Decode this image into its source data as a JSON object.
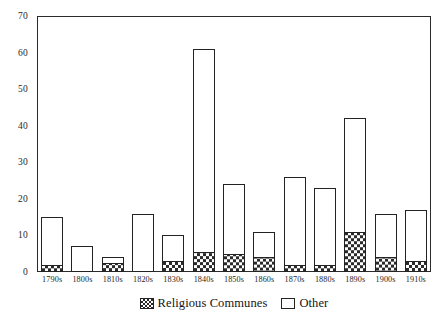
{
  "chart_data": {
    "type": "bar",
    "subtype": "stacked-vertical",
    "title": "",
    "subtitle": "",
    "xlabel": "",
    "ylabel": "",
    "categories": [
      "1790s",
      "1800s",
      "1810s",
      "1820s",
      "1830s",
      "1840s",
      "1850s",
      "1860s",
      "1870s",
      "1880s",
      "1890s",
      "1900s",
      "1910s"
    ],
    "series": [
      {
        "name": "Religious Communes",
        "fill": "checkered-hatch",
        "color": "#2a2a2a",
        "values": [
          2,
          0,
          2.5,
          0,
          3,
          5.5,
          5,
          4,
          2,
          2,
          11,
          4,
          3
        ]
      },
      {
        "name": "Other",
        "fill": "white",
        "color": "#ffffff",
        "values": [
          13,
          7,
          1.5,
          16,
          7,
          55.5,
          19,
          7,
          24,
          21,
          31,
          12,
          14
        ]
      }
    ],
    "totals": [
      15,
      7,
      4,
      16,
      10,
      61,
      24,
      11,
      26,
      23,
      42,
      16,
      17
    ],
    "ylim": [
      0,
      70
    ],
    "yticks": [
      0,
      10,
      20,
      30,
      40,
      50,
      60,
      70
    ],
    "ytick_labels": [
      "0",
      "10",
      "20",
      "30",
      "40",
      "50",
      "60",
      "70"
    ],
    "grid": false,
    "legend_position": "bottom-center",
    "axis_color": "#2b2b2b",
    "bar_edge_color": "#232323"
  },
  "legend": {
    "items": [
      {
        "label": "Religious Communes",
        "swatch": "checkered-swatch-icon"
      },
      {
        "label": "Other",
        "swatch": "white-swatch-icon"
      }
    ]
  }
}
